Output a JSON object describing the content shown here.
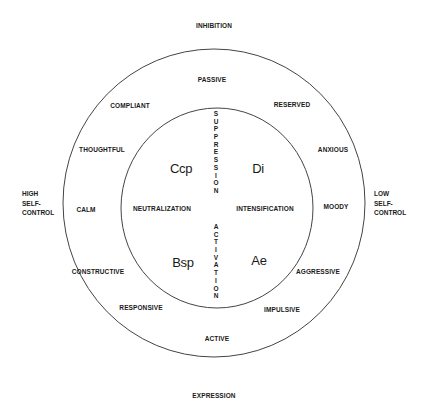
{
  "diagram": {
    "axes": {
      "top": "INHIBITION",
      "bottom": "EXPRESSION",
      "left": [
        "HIGH",
        "SELF-",
        "CONTROL"
      ],
      "right": [
        "LOW",
        "SELF-",
        "CONTROL"
      ]
    },
    "outer_ring": {
      "passive": "PASSIVE",
      "compliant": "COMPLIANT",
      "reserved": "RESERVED",
      "thoughtful": "THOUGHTFUL",
      "anxious": "ANXIOUS",
      "calm": "CALM",
      "moody": "MOODY",
      "constructive": "CONSTRUCTIVE",
      "aggressive": "AGGRESSIVE",
      "responsive": "RESPONSIVE",
      "impulsive": "IMPULSIVE",
      "active": "ACTIVE"
    },
    "inner_circle": {
      "neutralization": "NEUTRALIZATION",
      "intensification": "INTENSIFICATION",
      "vertical_top": "SUPPRESSION",
      "vertical_bottom": "ACTIVATION",
      "quadrants": {
        "top_left": "Ccp",
        "top_right": "Di",
        "bottom_left": "Bsp",
        "bottom_right": "Ae"
      }
    },
    "colors": {
      "line": "#444444",
      "text": "#1a1a1a",
      "background": "#ffffff"
    }
  }
}
